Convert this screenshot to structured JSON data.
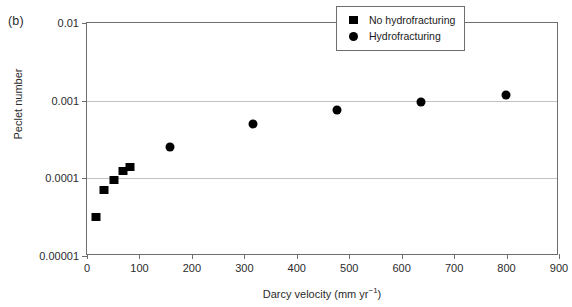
{
  "figure": {
    "panel_label": "(b)"
  },
  "chart_data": {
    "type": "scatter",
    "title": "",
    "xlabel": "Darcy velocity (mm yr−1)",
    "xlabel_base": "Darcy velocity (mm yr",
    "xlabel_sup": "−1",
    "xlabel_tail": ")",
    "ylabel": "Peclet number",
    "xlim": [
      0,
      900
    ],
    "ylim": [
      1e-05,
      0.01
    ],
    "yscale": "log",
    "xscale": "linear",
    "grid": "horizontal-gridlines-at-y-decades",
    "legend_position": "top-right",
    "xticks": [
      0,
      100,
      200,
      300,
      400,
      500,
      600,
      700,
      800,
      900
    ],
    "xticklabels": [
      "0",
      "100",
      "200",
      "300",
      "400",
      "500",
      "600",
      "700",
      "800",
      "900"
    ],
    "yticks": [
      0.01,
      0.001,
      0.0001,
      1e-05
    ],
    "yticklabels": [
      "0.01",
      "0.001",
      "0.0001",
      "0.00001"
    ],
    "series": [
      {
        "name": "No hydrofracturing",
        "marker": "square",
        "color": "#000000",
        "points": [
          {
            "x": 17,
            "y": 3.2e-05
          },
          {
            "x": 32,
            "y": 7e-05
          },
          {
            "x": 51,
            "y": 9.5e-05
          },
          {
            "x": 69,
            "y": 0.000125
          },
          {
            "x": 82,
            "y": 0.000142
          }
        ]
      },
      {
        "name": "Hydrofracturing",
        "marker": "circle",
        "color": "#000000",
        "points": [
          {
            "x": 158,
            "y": 0.00025
          },
          {
            "x": 317,
            "y": 0.0005
          },
          {
            "x": 477,
            "y": 0.00076
          },
          {
            "x": 637,
            "y": 0.00096
          },
          {
            "x": 799,
            "y": 0.0012
          }
        ]
      }
    ]
  },
  "legend": {
    "items": [
      {
        "label": "No hydrofracturing",
        "marker": "square"
      },
      {
        "label": "Hydrofracturing",
        "marker": "circle"
      }
    ]
  }
}
